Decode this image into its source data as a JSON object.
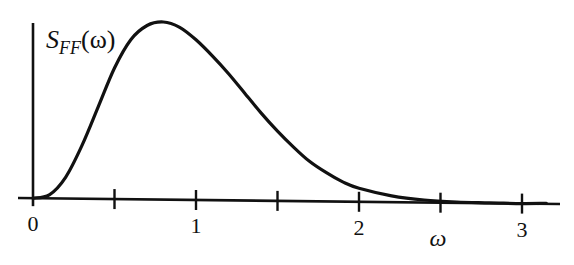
{
  "chart_data": {
    "type": "line",
    "title": "",
    "xlabel": "ω",
    "ylabel": "S_FF(ω)",
    "ylabel_parts": {
      "main": "S",
      "sub": "FF",
      "arg": "(ω)"
    },
    "xlim": [
      0,
      3.2
    ],
    "ylim": [
      0,
      1
    ],
    "grid": false,
    "legend": null,
    "x_ticks": [
      0,
      0.5,
      1,
      1.5,
      2,
      2.5,
      3
    ],
    "x_tick_labels": [
      {
        "value": 0,
        "label": "0"
      },
      {
        "value": 1,
        "label": "1"
      },
      {
        "value": 2,
        "label": "2"
      },
      {
        "value": 3,
        "label": "3"
      }
    ],
    "series": [
      {
        "name": "S_FF(ω)",
        "x": [
          0,
          0.1,
          0.2,
          0.3,
          0.4,
          0.5,
          0.6,
          0.7,
          0.8,
          0.9,
          1.0,
          1.1,
          1.2,
          1.3,
          1.4,
          1.5,
          1.6,
          1.7,
          1.8,
          1.9,
          2.0,
          2.2,
          2.4,
          2.6,
          2.8,
          3.0
        ],
        "y": [
          0,
          0.02,
          0.12,
          0.3,
          0.52,
          0.74,
          0.9,
          0.98,
          1.0,
          0.97,
          0.9,
          0.81,
          0.71,
          0.6,
          0.49,
          0.39,
          0.3,
          0.22,
          0.16,
          0.11,
          0.075,
          0.035,
          0.014,
          0.005,
          0.002,
          0.0
        ]
      }
    ],
    "annotations": []
  },
  "colors": {
    "ink": "#111111",
    "background": "#ffffff"
  }
}
